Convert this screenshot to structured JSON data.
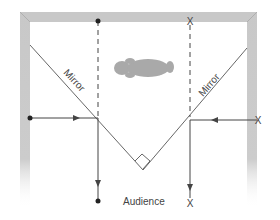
{
  "diagram": {
    "labels": {
      "mirror_left": "Mirror",
      "mirror_right": "Mirror",
      "audience": "Audience",
      "object_marker": "X",
      "image_marker": "X",
      "ray_end_marker": "X"
    },
    "colors": {
      "wall": "#c8c8c8",
      "wall_edge": "#a8a8a8",
      "line": "#444444",
      "figure": "#a9a9a9",
      "text": "#444444"
    },
    "elements": {
      "frame": "Room walls (top, left, right) fading toward audience side",
      "mirrors": "Two mirrors at 45 degrees meeting at a right angle",
      "figure": "Person lying down (top view) between mirrors",
      "rays": [
        "Left: dot on left wall -> arrow right -> reflects at left mirror -> down to dot",
        "Right: X on right wall -> arrow left -> reflects at right mirror -> down to X",
        "Dashed extensions upward to top wall (dot on left, X on right)"
      ]
    }
  }
}
